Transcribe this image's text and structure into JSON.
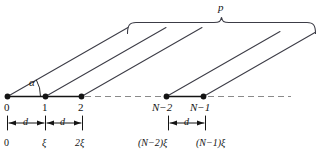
{
  "figure": {
    "type": "geometry-diagram",
    "angle_label": "α",
    "bracket_label": "p",
    "spacing_label": "d",
    "node_indices": [
      "0",
      "1",
      "2",
      "N−2",
      "N−1"
    ],
    "position_labels": [
      "0",
      "ξ",
      "2ξ",
      "(N−2)ξ",
      "(N−1)ξ"
    ],
    "dimension_labels": [
      "d",
      "d",
      "d"
    ],
    "colors": {
      "line": "#141414",
      "dash": "#7a7a7a",
      "ray": "#3c3c46",
      "text": "#141414",
      "background": "#ffffff"
    }
  }
}
